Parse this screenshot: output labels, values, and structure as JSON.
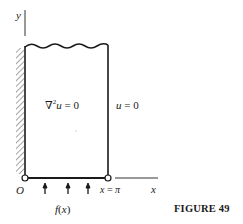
{
  "figure": {
    "caption": "FIGURE 49",
    "labels": {
      "y_axis": "y",
      "x_axis": "x",
      "origin": "O",
      "right_bound": "x = π",
      "pde": "∇²u = 0",
      "right_bc": "u = 0",
      "bottom_bc": "f(x)"
    },
    "colors": {
      "line": "#1a1a1a",
      "hatch": "#555555",
      "background": "#ffffff"
    },
    "geometry": {
      "strip_left_x": 25,
      "strip_right_x": 108,
      "strip_top_y": 46,
      "strip_bottom_y": 178,
      "arrow_positions_x": [
        45,
        68,
        88
      ]
    }
  }
}
